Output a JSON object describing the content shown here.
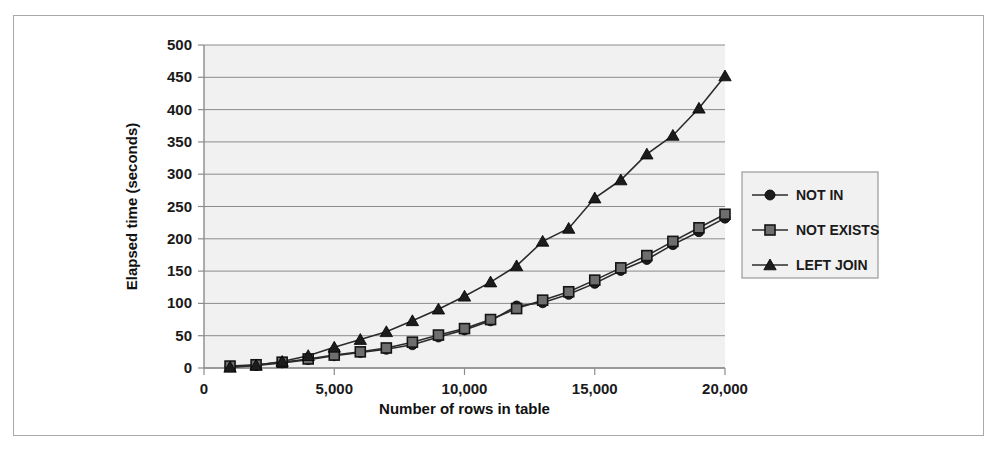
{
  "chart_data": {
    "type": "line",
    "title": "",
    "xlabel": "Number of rows in table",
    "ylabel": "Elapsed time (seconds)",
    "xlim": [
      0,
      20000
    ],
    "ylim": [
      0,
      500
    ],
    "xticks": [
      0,
      5000,
      10000,
      15000,
      20000
    ],
    "xtick_labels": [
      "0",
      "5,000",
      "10,000",
      "15,000",
      "20,000"
    ],
    "yticks": [
      0,
      50,
      100,
      150,
      200,
      250,
      300,
      350,
      400,
      450,
      500
    ],
    "ytick_labels": [
      "0",
      "50",
      "100",
      "150",
      "200",
      "250",
      "300",
      "350",
      "400",
      "450",
      "500"
    ],
    "grid": true,
    "grid_axis": "y",
    "legend_position": "right",
    "plot_background": "#f1f1f1",
    "x": [
      1000,
      2000,
      3000,
      4000,
      5000,
      6000,
      7000,
      8000,
      9000,
      10000,
      11000,
      12000,
      13000,
      14000,
      15000,
      16000,
      17000,
      18000,
      19000,
      20000
    ],
    "series": [
      {
        "name": "NOT IN",
        "marker": "circle",
        "color": "#1c1c1c",
        "values": [
          2,
          4,
          8,
          13,
          19,
          24,
          29,
          36,
          48,
          59,
          73,
          96,
          101,
          114,
          131,
          151,
          168,
          191,
          211,
          232
        ]
      },
      {
        "name": "NOT EXISTS",
        "marker": "square",
        "color": "#6e6e6e",
        "values": [
          3,
          5,
          9,
          14,
          20,
          25,
          31,
          40,
          51,
          61,
          75,
          92,
          105,
          118,
          136,
          155,
          174,
          196,
          217,
          238
        ]
      },
      {
        "name": "LEFT JOIN",
        "marker": "triangle",
        "color": "#1c1c1c",
        "values": [
          1,
          4,
          10,
          19,
          32,
          44,
          56,
          73,
          91,
          111,
          133,
          158,
          196,
          216,
          263,
          291,
          331,
          360,
          402,
          452
        ]
      }
    ]
  },
  "legend": {
    "entries": [
      {
        "label": "NOT IN",
        "marker": "circle"
      },
      {
        "label": "NOT EXISTS",
        "marker": "square"
      },
      {
        "label": "LEFT JOIN",
        "marker": "triangle"
      }
    ]
  }
}
